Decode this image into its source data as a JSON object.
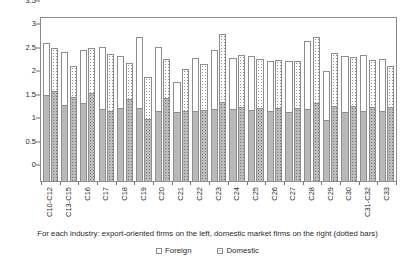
{
  "caption": "For each industry: export-oriented firms on the left, domestic market firms on the right (dotted bars)",
  "legend": {
    "items": [
      {
        "label": "Foreign",
        "swatch": "open-square-icon"
      },
      {
        "label": "Domestic",
        "swatch": "dotted-square-icon"
      }
    ]
  },
  "chart_data": {
    "type": "bar",
    "subtype": "grouped-stacked",
    "title": "",
    "xlabel": "",
    "ylabel": "",
    "ylim": [
      0,
      3.5
    ],
    "ytick_labels": [
      "0",
      "0.5",
      "1",
      "1.5",
      "2",
      "2.5",
      "3",
      "3.5"
    ],
    "ytick_values": [
      0,
      0.5,
      1,
      1.5,
      2,
      2.5,
      3,
      3.5
    ],
    "grid": false,
    "legend_position": "bottom",
    "categories": [
      "C10-C12",
      "C13-C15",
      "C16",
      "C17",
      "C18",
      "C19",
      "C20",
      "C21",
      "C22",
      "C23",
      "C24",
      "C25",
      "C26",
      "C27",
      "C28",
      "C29",
      "C30",
      "C31-C32",
      "C33"
    ],
    "bar_groups": [
      {
        "bar": "export",
        "name": "Export-oriented firms (left, plain bars)"
      },
      {
        "bar": "domestic",
        "name": "Domestic market firms (right, dotted bars)"
      }
    ],
    "series": [
      {
        "name": "Export-oriented firms total",
        "bar": "export",
        "values": [
          2.97,
          2.77,
          2.81,
          2.89,
          2.68,
          3.09,
          2.89,
          2.14,
          2.65,
          2.82,
          2.64,
          2.68,
          2.59,
          2.58,
          3.01,
          2.37,
          2.69,
          2.72,
          2.62
        ]
      },
      {
        "name": "Export-oriented firms foreign (lower segment)",
        "bar": "export",
        "values": [
          1.84,
          1.63,
          1.66,
          1.53,
          1.56,
          1.55,
          1.49,
          1.47,
          1.49,
          1.53,
          1.54,
          1.51,
          1.5,
          1.48,
          1.53,
          1.31,
          1.48,
          1.49,
          1.5
        ]
      },
      {
        "name": "Domestic market firms total",
        "bar": "domestic",
        "values": [
          2.87,
          2.48,
          2.85,
          2.73,
          2.55,
          2.24,
          2.62,
          2.42,
          2.52,
          3.16,
          2.72,
          2.62,
          2.6,
          2.59,
          3.1,
          2.75,
          2.66,
          2.6,
          2.47
        ]
      },
      {
        "name": "Domestic market firms foreign (lower segment)",
        "bar": "domestic",
        "values": [
          1.92,
          1.79,
          1.88,
          1.5,
          1.74,
          1.33,
          1.77,
          1.5,
          1.51,
          1.68,
          1.58,
          1.56,
          1.55,
          1.56,
          1.66,
          1.6,
          1.61,
          1.58,
          1.57
        ]
      }
    ]
  }
}
